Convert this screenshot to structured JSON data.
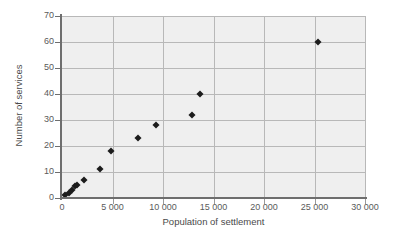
{
  "chart_data": {
    "type": "scatter",
    "title": "",
    "xlabel": "Population of settlement",
    "ylabel": "Number of services",
    "xlim": [
      0,
      30000
    ],
    "ylim": [
      0,
      70
    ],
    "grid": true,
    "legend": null,
    "xticks": [
      0,
      5000,
      10000,
      15000,
      20000,
      25000,
      30000
    ],
    "xtick_labels": [
      "0",
      "5 000",
      "10 000",
      "15 000",
      "20 000",
      "25 000",
      "30 000"
    ],
    "yticks": [
      0,
      10,
      20,
      30,
      40,
      50,
      60,
      70
    ],
    "ytick_labels": [
      "0",
      "10",
      "20",
      "30",
      "40",
      "50",
      "60",
      "70"
    ],
    "series": [
      {
        "name": "settlements",
        "marker": "diamond",
        "color": "#1c1c1c",
        "points": [
          {
            "x": 300,
            "y": 1
          },
          {
            "x": 650,
            "y": 2
          },
          {
            "x": 950,
            "y": 3
          },
          {
            "x": 1250,
            "y": 4.5
          },
          {
            "x": 1450,
            "y": 5
          },
          {
            "x": 2200,
            "y": 7
          },
          {
            "x": 3800,
            "y": 11
          },
          {
            "x": 4900,
            "y": 18
          },
          {
            "x": 7500,
            "y": 23
          },
          {
            "x": 9300,
            "y": 28
          },
          {
            "x": 12900,
            "y": 32
          },
          {
            "x": 13700,
            "y": 40
          },
          {
            "x": 25300,
            "y": 60
          }
        ]
      }
    ],
    "colors": {
      "plot_background": "#efefef",
      "figure_background": "#ffffff",
      "gridline": "#b8b8b8",
      "axis_line": "#6e6e6e",
      "tick_label": "#5a5a5a",
      "axis_title": "#4a4a4a",
      "marker": "#1c1c1c"
    }
  }
}
